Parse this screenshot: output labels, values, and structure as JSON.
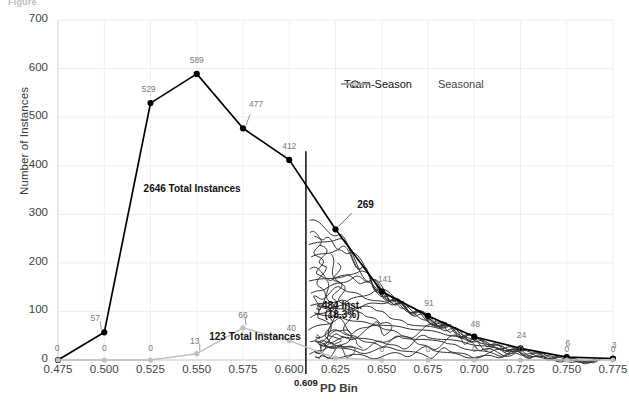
{
  "figure": {
    "caption_left": "Figure",
    "caption_right": ""
  },
  "chart_data": {
    "type": "line",
    "title": "",
    "xlabel": "PD Bin",
    "ylabel": "Number of Instances",
    "xlim": [
      0.475,
      0.775
    ],
    "ylim": [
      0,
      700
    ],
    "ytick_labels": [
      "0",
      "100",
      "200",
      "300",
      "400",
      "500",
      "600",
      "700"
    ],
    "ytick_values": [
      0,
      100,
      200,
      300,
      400,
      500,
      600,
      700
    ],
    "grid": true,
    "legend_position": "top-center",
    "categories": [
      "0.475",
      "0.500",
      "0.525",
      "0.550",
      "0.575",
      "0.600",
      "0.625",
      "0.650",
      "0.675",
      "0.700",
      "0.725",
      "0.750",
      "0.775"
    ],
    "x": [
      0.475,
      0.5,
      0.525,
      0.55,
      0.575,
      0.6,
      0.625,
      0.65,
      0.675,
      0.7,
      0.725,
      0.75,
      0.775
    ],
    "series": [
      {
        "name": "Team-Season",
        "color": "#000000",
        "marker": "circle",
        "values": [
          0,
          57,
          529,
          589,
          477,
          412,
          269,
          141,
          91,
          48,
          24,
          6,
          3
        ],
        "labels": [
          "0",
          "57",
          "529",
          "589",
          "477",
          "412",
          "269",
          "141",
          "91",
          "48",
          "24",
          "6",
          "3"
        ]
      },
      {
        "name": "Seasonal",
        "color": "#bfbfbf",
        "marker": "circle",
        "values": [
          0,
          0,
          0,
          13,
          66,
          40,
          4,
          0,
          0,
          0,
          0,
          0,
          0
        ],
        "labels": [
          "0",
          "0",
          "0",
          "13",
          "66",
          "40",
          "4",
          "0",
          "0",
          "0",
          "0",
          "0",
          "0"
        ]
      }
    ],
    "annotations": [
      {
        "name": "team-season-total",
        "text": "2646 Total Instances",
        "x": 0.5475,
        "y": 352
      },
      {
        "name": "seasonal-total",
        "text": "123 Total Instances",
        "x": 0.5815,
        "y": 47
      },
      {
        "name": "shaded-region-count",
        "text": "484 Inst.",
        "x": 0.6285,
        "y": 112
      },
      {
        "name": "shaded-region-percent",
        "text": "(18.3%)",
        "x": 0.6285,
        "y": 92
      }
    ],
    "cutoff_line": {
      "name": "pd-cutoff",
      "value": 0.609,
      "label": "0.609",
      "color": "#1a1a1a"
    }
  },
  "legend": {
    "items": [
      {
        "label": "Team-Season",
        "color": "#000000"
      },
      {
        "label": "Seasonal",
        "color": "#c6c6c6"
      }
    ]
  }
}
